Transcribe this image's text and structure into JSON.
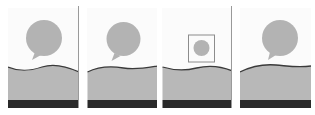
{
  "figure": {
    "colors": {
      "background": "#fbfbfb",
      "bubble": "#b3b3b3",
      "ground": "#b8b8b8",
      "horizon_line": "#3a3a3a",
      "base_strip": "#2a2a2a",
      "frame": "#8c8c8c",
      "divider": "#9a9a9a"
    },
    "panels": [
      {
        "id": 1,
        "variant": "bubble-large",
        "has_frame": false
      },
      {
        "id": 2,
        "variant": "bubble-large",
        "has_frame": false
      },
      {
        "id": 3,
        "variant": "bubble-small-framed",
        "has_frame": true
      },
      {
        "id": 4,
        "variant": "bubble-large",
        "has_frame": false
      }
    ]
  }
}
